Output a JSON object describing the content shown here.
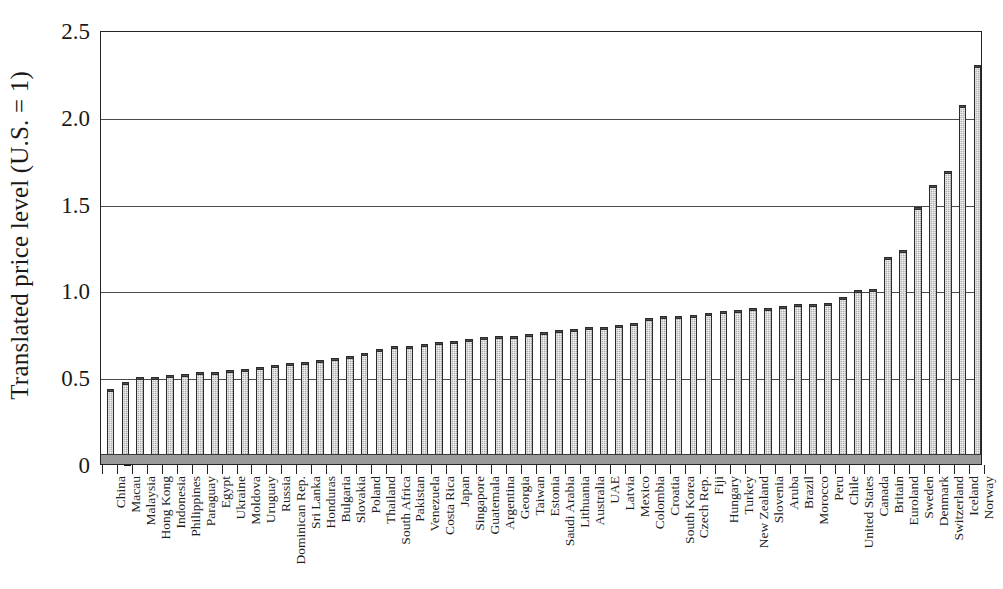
{
  "chart_data": {
    "type": "bar",
    "title": "",
    "xlabel": "",
    "ylabel": "Translated price level (U.S. = 1)",
    "ylim": [
      0,
      2.5
    ],
    "yticks": [
      0,
      0.5,
      1.0,
      1.5,
      2.0,
      2.5
    ],
    "ytick_labels": [
      "0",
      "0.5",
      "1.0",
      "1.5",
      "2.0",
      "2.5"
    ],
    "grid": "horizontal",
    "legend": "none",
    "bar_color": "#a9a9a9",
    "bar_edge_color": "#2b2b2b",
    "categories": [
      "China",
      "Macau",
      "Malaysia",
      "Hong Kong",
      "Indonesia",
      "Philippines",
      "Paraguay",
      "Egypt",
      "Ukraine",
      "Moldova",
      "Uruguay",
      "Russia",
      "Dominican Rep.",
      "Sri Lanka",
      "Honduras",
      "Bulgaria",
      "Slovakia",
      "Poland",
      "Thailand",
      "South Africa",
      "Pakistan",
      "Venezuela",
      "Costa Rica",
      "Japan",
      "Singapore",
      "Guatemala",
      "Argentina",
      "Georgia",
      "Taiwan",
      "Estonia",
      "Saudi Arabia",
      "Lithuania",
      "Australia",
      "UAE",
      "Latvia",
      "Mexico",
      "Colombia",
      "Croatia",
      "South Korea",
      "Czech Rep.",
      "Fiji",
      "Hungary",
      "Turkey",
      "New Zealand",
      "Slovenia",
      "Aruba",
      "Brazil",
      "Morocco",
      "Peru",
      "Chile",
      "United States",
      "Canada",
      "Britain",
      "Euroland",
      "Sweden",
      "Denmark",
      "Switzerland",
      "Iceland",
      "Norway"
    ],
    "values": [
      0.43,
      0.47,
      0.5,
      0.5,
      0.51,
      0.52,
      0.53,
      0.53,
      0.54,
      0.55,
      0.56,
      0.57,
      0.58,
      0.59,
      0.6,
      0.61,
      0.62,
      0.64,
      0.66,
      0.68,
      0.68,
      0.69,
      0.7,
      0.71,
      0.72,
      0.73,
      0.74,
      0.74,
      0.75,
      0.76,
      0.77,
      0.78,
      0.79,
      0.79,
      0.8,
      0.81,
      0.84,
      0.85,
      0.85,
      0.86,
      0.87,
      0.88,
      0.89,
      0.9,
      0.9,
      0.91,
      0.92,
      0.92,
      0.93,
      0.96,
      1.0,
      1.01,
      1.19,
      1.23,
      1.48,
      1.61,
      1.69,
      2.07,
      2.3
    ]
  }
}
